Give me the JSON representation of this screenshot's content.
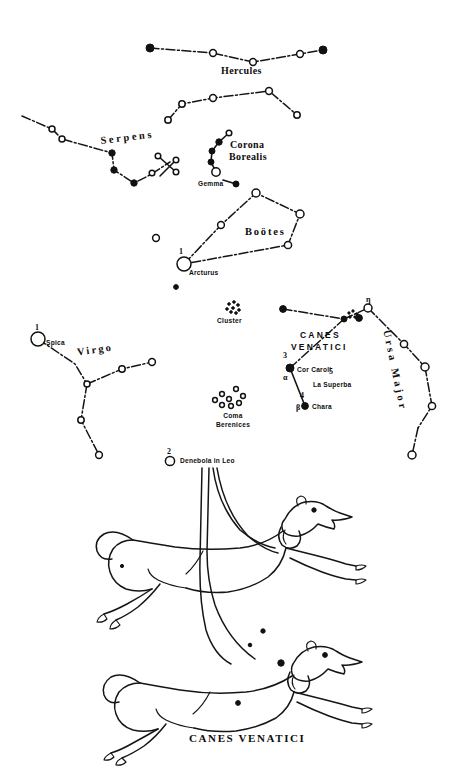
{
  "figure": {
    "caption": "CANES  VENATICI",
    "medium": "engraved star chart with constellation figure"
  },
  "constellation_labels": [
    {
      "name": "hercules-label",
      "text": "Hercules",
      "x": 221,
      "y": 66,
      "style": "plain",
      "rotate": 0
    },
    {
      "name": "serpens-label",
      "text": "Serpens",
      "x": 100,
      "y": 136,
      "style": "serif",
      "rotate": -7
    },
    {
      "name": "corona-borealis-line1",
      "text": "Corona",
      "x": 230,
      "y": 140,
      "style": "plain",
      "rotate": 0
    },
    {
      "name": "corona-borealis-line2",
      "text": "Borealis",
      "x": 229,
      "y": 152,
      "style": "plain",
      "rotate": 0
    },
    {
      "name": "bootes-label",
      "text": "Boötes",
      "x": 245,
      "y": 227,
      "style": "serif",
      "rotate": 0
    },
    {
      "name": "virgo-label",
      "text": "Virgo",
      "x": 77,
      "y": 345,
      "style": "serif",
      "rotate": -8
    },
    {
      "name": "canes-venatici-line1",
      "text": "CANES",
      "x": 300,
      "y": 335,
      "style": "wide",
      "rotate": 0
    },
    {
      "name": "canes-venatici-line2",
      "text": "VENATICI",
      "x": 294,
      "y": 346,
      "style": "wide",
      "rotate": 0
    },
    {
      "name": "ursa-major-label",
      "text": "Ursa Major",
      "x": 391,
      "y": 329,
      "style": "serif",
      "rotate": 78
    }
  ],
  "stars": [
    {
      "name": "spica",
      "label": "Spica",
      "magnitude": "1",
      "x": 38,
      "y": 339,
      "size": "bright"
    },
    {
      "name": "arcturus",
      "label": "Arcturus",
      "magnitude": "1",
      "x": 184,
      "y": 264,
      "size": "bright"
    },
    {
      "name": "gemma",
      "label": "Gemma",
      "magnitude": "",
      "x": 218,
      "y": 176,
      "size": "medium"
    },
    {
      "name": "cor-caroli",
      "label": "Cor Caroli",
      "magnitude": "3",
      "x": 289,
      "y": 368,
      "size": "filled",
      "greek": "α"
    },
    {
      "name": "la-superba",
      "label": "La Superba",
      "magnitude": "5",
      "x": 318,
      "y": 382,
      "size": "none"
    },
    {
      "name": "chara",
      "label": "Chara",
      "magnitude": "4",
      "x": 305,
      "y": 406,
      "size": "filled",
      "greek": "β"
    },
    {
      "name": "denebola",
      "label": "Denebola in Leo",
      "magnitude": "2",
      "x": 170,
      "y": 461,
      "size": "medium"
    },
    {
      "name": "eta-um",
      "label": "",
      "magnitude": "",
      "x": 368,
      "y": 308,
      "size": "small",
      "greek": "η"
    }
  ],
  "deep_sky": [
    {
      "name": "coma-cluster",
      "label": "Cluster",
      "x": 233,
      "y": 313
    },
    {
      "name": "coma-berenices",
      "label_line1": "Coma",
      "label_line2": "Berenices",
      "x": 227,
      "y": 407
    },
    {
      "name": "whirlpool-galaxy",
      "label": "",
      "x": 352,
      "y": 317
    }
  ],
  "figure_parts": [
    {
      "name": "upper-dog-asterion",
      "label": "upper hunting dog"
    },
    {
      "name": "lower-dog-chara",
      "label": "lower hunting dog"
    },
    {
      "name": "leash-cords",
      "label": "leashes held by Boötes"
    }
  ],
  "colors": {
    "ink": "#111111",
    "paper": "#ffffff"
  }
}
